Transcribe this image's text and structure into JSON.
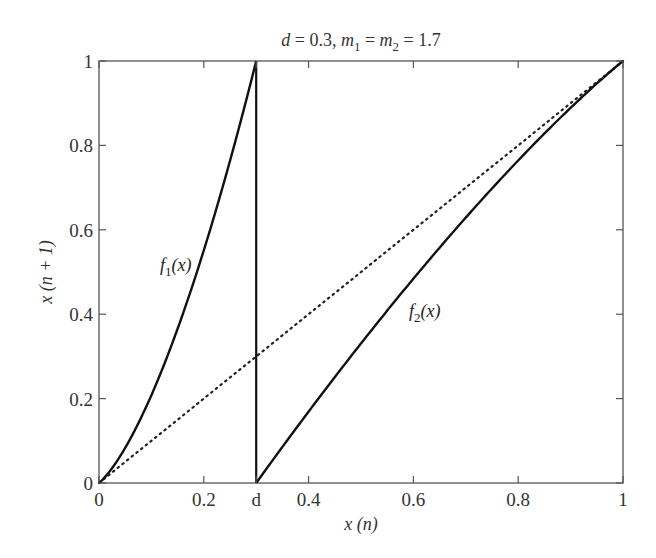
{
  "chart_data": {
    "type": "line",
    "title": "d = 0.3, m1 = m2 = 1.7",
    "title_parts": {
      "d": "d",
      "d_val": " = 0.3, ",
      "m": "m",
      "sub1": "1",
      "eq": " = ",
      "sub2": "2",
      "val": " = 1.7"
    },
    "xlabel": "x (n)",
    "ylabel": "x (n + 1)",
    "xlim": [
      0,
      1
    ],
    "ylim": [
      0,
      1
    ],
    "grid": false,
    "legend": "none",
    "params": {
      "d": 0.3,
      "m1": 1.7,
      "m2": 1.7
    },
    "x_ticks": [
      {
        "value": 0,
        "label": "0"
      },
      {
        "value": 0.2,
        "label": "0.2"
      },
      {
        "value": 0.3,
        "label": "d"
      },
      {
        "value": 0.4,
        "label": "0.4"
      },
      {
        "value": 0.6,
        "label": "0.6"
      },
      {
        "value": 0.8,
        "label": "0.8"
      },
      {
        "value": 1,
        "label": "1"
      }
    ],
    "y_ticks": [
      {
        "value": 0,
        "label": "0"
      },
      {
        "value": 0.2,
        "label": "0.2"
      },
      {
        "value": 0.4,
        "label": "0.4"
      },
      {
        "value": 0.6,
        "label": "0.6"
      },
      {
        "value": 0.8,
        "label": "0.8"
      },
      {
        "value": 1,
        "label": "1"
      }
    ],
    "series": [
      {
        "name": "f1(x)",
        "label": "f1(x)",
        "style": "solid",
        "domain": [
          0,
          0.3
        ],
        "x": [
          0,
          0.05,
          0.1,
          0.15,
          0.2,
          0.25,
          0.3
        ],
        "y": [
          0,
          0.087,
          0.198,
          0.331,
          0.551,
          0.74,
          1.0
        ]
      },
      {
        "name": "f2(x)",
        "label": "f2(x)",
        "style": "solid",
        "domain": [
          0.3,
          1
        ],
        "x": [
          0.3,
          0.4,
          0.5,
          0.6,
          0.7,
          0.8,
          0.9,
          1.0
        ],
        "y": [
          0,
          0.168,
          0.321,
          0.484,
          0.614,
          0.758,
          0.889,
          1.0
        ]
      },
      {
        "name": "identity",
        "label": "",
        "style": "dotted",
        "x": [
          0,
          1
        ],
        "y": [
          0,
          1
        ]
      }
    ],
    "annotations": [
      {
        "text": "f1(x)",
        "x": 0.12,
        "y": 0.55
      },
      {
        "text": "f2(x)",
        "x": 0.56,
        "y": 0.42
      }
    ]
  }
}
